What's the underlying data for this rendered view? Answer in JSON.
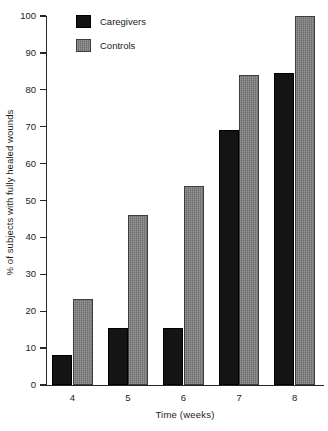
{
  "chart_data": {
    "type": "bar",
    "title": "",
    "subtitle": "",
    "xlabel": "Time (weeks)",
    "ylabel": "% of subjects with fully healed wounds",
    "categories": [
      "4",
      "5",
      "6",
      "7",
      "8"
    ],
    "series": [
      {
        "name": "Caregivers",
        "color": "#141414",
        "values": [
          8,
          15.5,
          15.5,
          69,
          84.5
        ]
      },
      {
        "name": "Controls",
        "color": "#7d7d7d",
        "values": [
          23.4,
          46,
          54,
          84,
          100
        ]
      }
    ],
    "ylim": [
      0,
      100
    ],
    "yticks": [
      0,
      10,
      20,
      30,
      40,
      50,
      60,
      70,
      80,
      90,
      100
    ],
    "ytick_labels": [
      "0",
      "10",
      "20",
      "30",
      "40",
      "50",
      "60",
      "70",
      "80",
      "90",
      "100"
    ],
    "xtick_labels": [
      "4",
      "5",
      "6",
      "7",
      "8"
    ],
    "grid": false,
    "legend_position": "top-left",
    "legend_entries": [
      "Caregivers",
      "Controls"
    ]
  }
}
